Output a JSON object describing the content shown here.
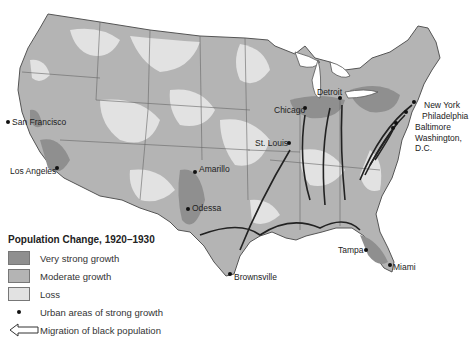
{
  "legend": {
    "title": "Population Change, 1920–1930",
    "items": [
      {
        "label": "Very strong growth",
        "color": "#8f8f8f"
      },
      {
        "label": "Moderate growth",
        "color": "#b4b4b4"
      },
      {
        "label": "Loss",
        "color": "#e2e2e2"
      }
    ],
    "urban_label": "Urban areas of strong growth",
    "migration_label": "Migration of black population"
  },
  "cities": [
    {
      "name": "San Francisco",
      "x": 33,
      "y": 122
    },
    {
      "name": "Los Angeles",
      "x": 57,
      "y": 168
    },
    {
      "name": "Amarillo",
      "x": 195,
      "y": 172
    },
    {
      "name": "Odessa",
      "x": 188,
      "y": 209
    },
    {
      "name": "Brownsville",
      "x": 230,
      "y": 275
    },
    {
      "name": "Tampa",
      "x": 366,
      "y": 250
    },
    {
      "name": "Miami",
      "x": 390,
      "y": 265
    },
    {
      "name": "Chicago",
      "x": 305,
      "y": 108
    },
    {
      "name": "Detroit",
      "x": 340,
      "y": 98
    },
    {
      "name": "St. Louis",
      "x": 289,
      "y": 143
    },
    {
      "name": "New York",
      "x": 414,
      "y": 102
    },
    {
      "name": "Philadelphia",
      "x": 406,
      "y": 112
    },
    {
      "name": "Baltimore",
      "x": 396,
      "y": 123
    },
    {
      "name": "Washington, D.C.",
      "x": 393,
      "y": 128
    }
  ],
  "colors": {
    "very_strong": "#8f8f8f",
    "moderate": "#b4b4b4",
    "loss": "#e2e2e2",
    "water": "#ffffff",
    "border": "#555555",
    "arrow": "#222222"
  }
}
